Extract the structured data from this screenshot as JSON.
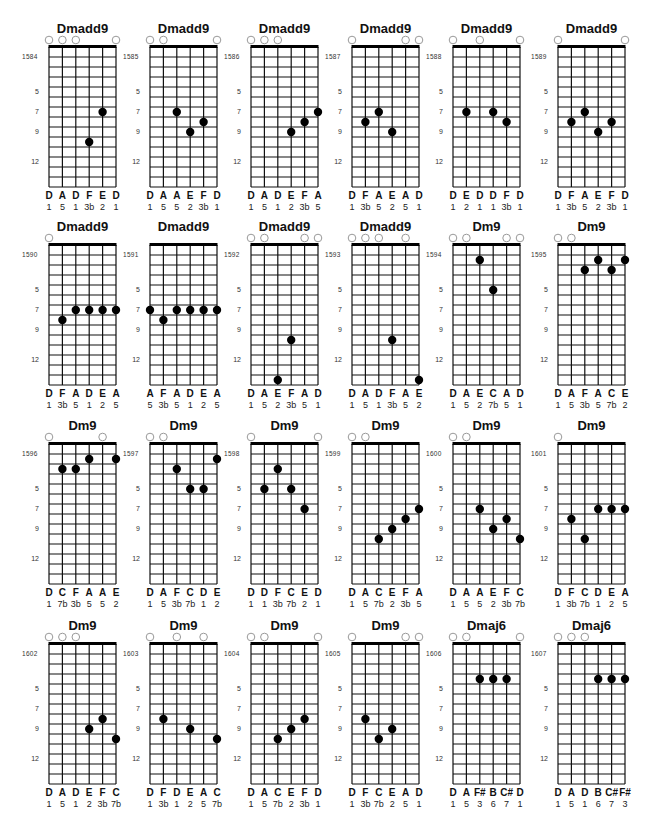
{
  "layout": {
    "grid_width": 67,
    "fret_spacing": 10,
    "num_frets": 14,
    "fret_markers": [
      5,
      7,
      9,
      12
    ],
    "dot_color": "#000000",
    "line_color": "#111111"
  },
  "chords": [
    {
      "id": "1584",
      "name": "Dmadd9",
      "notes": [
        "D",
        "A",
        "D",
        "F",
        "E",
        "D"
      ],
      "degrees": [
        "1",
        "5",
        "1",
        "3b",
        "2",
        "1"
      ],
      "open": [
        1,
        2,
        3,
        6
      ],
      "dots": [
        [
          4,
          10
        ],
        [
          5,
          7
        ]
      ]
    },
    {
      "id": "1585",
      "name": "Dmadd9",
      "notes": [
        "D",
        "A",
        "A",
        "E",
        "F",
        "D"
      ],
      "degrees": [
        "1",
        "5",
        "5",
        "2",
        "3b",
        "1"
      ],
      "open": [
        1,
        2,
        6
      ],
      "dots": [
        [
          3,
          7
        ],
        [
          4,
          9
        ],
        [
          5,
          8
        ]
      ]
    },
    {
      "id": "1586",
      "name": "Dmadd9",
      "notes": [
        "D",
        "A",
        "D",
        "E",
        "F",
        "A"
      ],
      "degrees": [
        "1",
        "5",
        "1",
        "2",
        "3b",
        "5"
      ],
      "open": [
        1,
        2,
        3
      ],
      "dots": [
        [
          4,
          9
        ],
        [
          5,
          8
        ],
        [
          6,
          7
        ]
      ]
    },
    {
      "id": "1587",
      "name": "Dmadd9",
      "notes": [
        "D",
        "F",
        "A",
        "E",
        "A",
        "D"
      ],
      "degrees": [
        "1",
        "3b",
        "5",
        "2",
        "5",
        "1"
      ],
      "open": [
        1,
        5,
        6
      ],
      "dots": [
        [
          2,
          8
        ],
        [
          3,
          7
        ],
        [
          4,
          9
        ]
      ]
    },
    {
      "id": "1588",
      "name": "Dmadd9",
      "notes": [
        "D",
        "E",
        "D",
        "D",
        "F",
        "D"
      ],
      "degrees": [
        "1",
        "2",
        "1",
        "1",
        "3b",
        "1"
      ],
      "open": [
        1,
        3,
        6
      ],
      "dots": [
        [
          2,
          7
        ],
        [
          4,
          7
        ],
        [
          5,
          8
        ]
      ]
    },
    {
      "id": "1589",
      "name": "Dmadd9",
      "notes": [
        "D",
        "F",
        "A",
        "E",
        "F",
        "D"
      ],
      "degrees": [
        "1",
        "3b",
        "5",
        "2",
        "3b",
        "1"
      ],
      "open": [
        1,
        6
      ],
      "dots": [
        [
          2,
          8
        ],
        [
          3,
          7
        ],
        [
          4,
          9
        ],
        [
          5,
          8
        ]
      ]
    },
    {
      "id": "1590",
      "name": "Dmadd9",
      "notes": [
        "D",
        "F",
        "A",
        "D",
        "E",
        "A"
      ],
      "degrees": [
        "1",
        "3b",
        "5",
        "1",
        "2",
        "5"
      ],
      "open": [
        1
      ],
      "dots": [
        [
          2,
          8
        ],
        [
          3,
          7
        ],
        [
          4,
          7
        ],
        [
          5,
          7
        ],
        [
          6,
          7
        ]
      ]
    },
    {
      "id": "1591",
      "name": "Dmadd9",
      "notes": [
        "A",
        "F",
        "A",
        "D",
        "E",
        "A"
      ],
      "degrees": [
        "5",
        "3b",
        "5",
        "1",
        "2",
        "5"
      ],
      "open": [],
      "dots": [
        [
          1,
          7
        ],
        [
          2,
          8
        ],
        [
          3,
          7
        ],
        [
          4,
          7
        ],
        [
          5,
          7
        ],
        [
          6,
          7
        ]
      ]
    },
    {
      "id": "1592",
      "name": "Dmadd9",
      "notes": [
        "D",
        "A",
        "E",
        "F",
        "A",
        "D"
      ],
      "degrees": [
        "1",
        "5",
        "2",
        "3b",
        "5",
        "1"
      ],
      "open": [
        1,
        2,
        5,
        6
      ],
      "dots": [
        [
          3,
          14
        ],
        [
          4,
          10
        ]
      ]
    },
    {
      "id": "1593",
      "name": "Dmadd9",
      "notes": [
        "D",
        "A",
        "D",
        "F",
        "A",
        "E"
      ],
      "degrees": [
        "1",
        "5",
        "1",
        "3b",
        "5",
        "2"
      ],
      "open": [
        1,
        2,
        3,
        5
      ],
      "dots": [
        [
          4,
          10
        ],
        [
          6,
          14
        ]
      ]
    },
    {
      "id": "1594",
      "name": "Dm9",
      "notes": [
        "D",
        "A",
        "E",
        "C",
        "A",
        "D"
      ],
      "degrees": [
        "1",
        "5",
        "2",
        "7b",
        "5",
        "1"
      ],
      "open": [
        1,
        2,
        5,
        6
      ],
      "dots": [
        [
          3,
          2
        ],
        [
          4,
          5
        ]
      ]
    },
    {
      "id": "1595",
      "name": "Dm9",
      "notes": [
        "D",
        "A",
        "F",
        "A",
        "C",
        "E"
      ],
      "degrees": [
        "1",
        "5",
        "3b",
        "5",
        "7b",
        "2"
      ],
      "open": [
        1,
        2
      ],
      "dots": [
        [
          3,
          3
        ],
        [
          4,
          2
        ],
        [
          5,
          3
        ],
        [
          6,
          2
        ]
      ]
    },
    {
      "id": "1596",
      "name": "Dm9",
      "notes": [
        "D",
        "C",
        "F",
        "A",
        "A",
        "E"
      ],
      "degrees": [
        "1",
        "7b",
        "3b",
        "5",
        "5",
        "2"
      ],
      "open": [
        1,
        5
      ],
      "dots": [
        [
          2,
          3
        ],
        [
          3,
          3
        ],
        [
          4,
          2
        ],
        [
          6,
          2
        ]
      ]
    },
    {
      "id": "1597",
      "name": "Dm9",
      "notes": [
        "D",
        "A",
        "F",
        "C",
        "D",
        "E"
      ],
      "degrees": [
        "1",
        "5",
        "3b",
        "7b",
        "1",
        "2"
      ],
      "open": [
        1,
        2
      ],
      "dots": [
        [
          3,
          3
        ],
        [
          4,
          5
        ],
        [
          5,
          5
        ],
        [
          6,
          2
        ]
      ]
    },
    {
      "id": "1598",
      "name": "Dm9",
      "notes": [
        "D",
        "D",
        "F",
        "C",
        "E",
        "D"
      ],
      "degrees": [
        "1",
        "1",
        "3b",
        "7b",
        "2",
        "1"
      ],
      "open": [
        1,
        6
      ],
      "dots": [
        [
          2,
          5
        ],
        [
          3,
          3
        ],
        [
          4,
          5
        ],
        [
          5,
          7
        ]
      ]
    },
    {
      "id": "1599",
      "name": "Dm9",
      "notes": [
        "D",
        "A",
        "C",
        "E",
        "F",
        "A"
      ],
      "degrees": [
        "1",
        "5",
        "7b",
        "2",
        "3b",
        "5"
      ],
      "open": [
        1,
        2
      ],
      "dots": [
        [
          3,
          10
        ],
        [
          4,
          9
        ],
        [
          5,
          8
        ],
        [
          6,
          7
        ]
      ]
    },
    {
      "id": "1600",
      "name": "Dm9",
      "notes": [
        "D",
        "A",
        "A",
        "E",
        "F",
        "C"
      ],
      "degrees": [
        "1",
        "5",
        "5",
        "2",
        "3b",
        "7b"
      ],
      "open": [
        1,
        2
      ],
      "dots": [
        [
          3,
          7
        ],
        [
          4,
          9
        ],
        [
          5,
          8
        ],
        [
          6,
          10
        ]
      ]
    },
    {
      "id": "1601",
      "name": "Dm9",
      "notes": [
        "D",
        "F",
        "C",
        "D",
        "E",
        "A"
      ],
      "degrees": [
        "1",
        "3b",
        "7b",
        "1",
        "2",
        "5"
      ],
      "open": [
        1
      ],
      "dots": [
        [
          2,
          8
        ],
        [
          3,
          10
        ],
        [
          4,
          7
        ],
        [
          5,
          7
        ],
        [
          6,
          7
        ]
      ]
    },
    {
      "id": "1602",
      "name": "Dm9",
      "notes": [
        "D",
        "A",
        "D",
        "E",
        "F",
        "C"
      ],
      "degrees": [
        "1",
        "5",
        "1",
        "2",
        "3b",
        "7b"
      ],
      "open": [
        1,
        2,
        3
      ],
      "dots": [
        [
          4,
          9
        ],
        [
          5,
          8
        ],
        [
          6,
          10
        ]
      ]
    },
    {
      "id": "1603",
      "name": "Dm9",
      "notes": [
        "D",
        "F",
        "D",
        "E",
        "A",
        "C"
      ],
      "degrees": [
        "1",
        "3b",
        "1",
        "2",
        "5",
        "7b"
      ],
      "open": [
        1,
        3,
        5
      ],
      "dots": [
        [
          2,
          8
        ],
        [
          4,
          9
        ],
        [
          6,
          10
        ]
      ]
    },
    {
      "id": "1604",
      "name": "Dm9",
      "notes": [
        "D",
        "A",
        "C",
        "E",
        "F",
        "D"
      ],
      "degrees": [
        "1",
        "5",
        "7b",
        "2",
        "3b",
        "1"
      ],
      "open": [
        1,
        2,
        6
      ],
      "dots": [
        [
          3,
          10
        ],
        [
          4,
          9
        ],
        [
          5,
          8
        ]
      ]
    },
    {
      "id": "1605",
      "name": "Dm9",
      "notes": [
        "D",
        "F",
        "C",
        "E",
        "A",
        "D"
      ],
      "degrees": [
        "1",
        "3b",
        "7b",
        "2",
        "5",
        "1"
      ],
      "open": [
        1,
        5,
        6
      ],
      "dots": [
        [
          2,
          8
        ],
        [
          3,
          10
        ],
        [
          4,
          9
        ]
      ]
    },
    {
      "id": "1606",
      "name": "Dmaj6",
      "notes": [
        "D",
        "A",
        "F#",
        "B",
        "C#",
        "D"
      ],
      "degrees": [
        "1",
        "5",
        "3",
        "6",
        "7",
        "1"
      ],
      "open": [
        1,
        2,
        6
      ],
      "dots": [
        [
          3,
          4
        ],
        [
          4,
          4
        ],
        [
          5,
          4
        ]
      ]
    },
    {
      "id": "1607",
      "name": "Dmaj6",
      "notes": [
        "D",
        "A",
        "D",
        "B",
        "C#",
        "F#"
      ],
      "degrees": [
        "1",
        "5",
        "1",
        "6",
        "7",
        "3"
      ],
      "open": [
        1,
        2,
        3
      ],
      "dots": [
        [
          4,
          4
        ],
        [
          5,
          4
        ],
        [
          6,
          4
        ]
      ]
    }
  ]
}
